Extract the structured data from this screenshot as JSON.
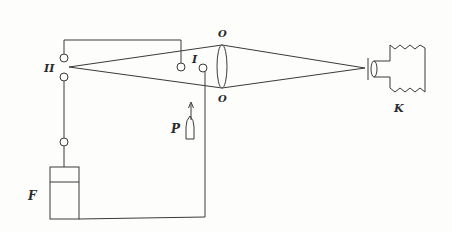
{
  "diagram": {
    "title": "",
    "colors": {
      "stroke": "#3a3a3a",
      "background": "#fdfdfc",
      "text": "#2a2a2a"
    },
    "labels": {
      "spark_gap_II": "II",
      "spark_gap_I": "I",
      "lens_top": "O",
      "lens_bottom": "O",
      "camera": "K",
      "probe": "P",
      "source": "F"
    }
  }
}
